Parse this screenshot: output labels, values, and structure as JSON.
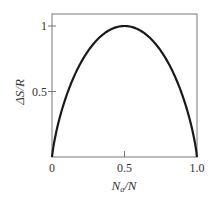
{
  "chart_data": {
    "type": "line",
    "title": "",
    "xlabel": "Na/N",
    "ylabel": "ΔS/R",
    "xlim": [
      0,
      1.0
    ],
    "ylim": [
      0,
      1.09
    ],
    "x_ticks": [
      {
        "value": 0,
        "label": "0"
      },
      {
        "value": 0.5,
        "label": "0.5"
      },
      {
        "value": 1.0,
        "label": "1.0"
      }
    ],
    "y_ticks": [
      {
        "value": 0.5,
        "label": "0.5"
      },
      {
        "value": 1,
        "label": "1"
      }
    ],
    "grid": false,
    "legend": null,
    "series": [
      {
        "name": "ΔS/R",
        "x": [
          0,
          0.02,
          0.05,
          0.1,
          0.15,
          0.2,
          0.25,
          0.3,
          0.35,
          0.4,
          0.45,
          0.5,
          0.55,
          0.6,
          0.65,
          0.7,
          0.75,
          0.8,
          0.85,
          0.9,
          0.95,
          0.98,
          1.0
        ],
        "values": [
          0,
          0.141,
          0.286,
          0.469,
          0.61,
          0.722,
          0.811,
          0.881,
          0.934,
          0.971,
          0.993,
          1.0,
          0.993,
          0.971,
          0.934,
          0.881,
          0.811,
          0.722,
          0.61,
          0.469,
          0.286,
          0.141,
          0
        ]
      }
    ]
  },
  "labels": {
    "xlabel_main": "N",
    "xlabel_sub": "a",
    "xlabel_tail": "/N",
    "ylabel": "ΔS/R"
  }
}
